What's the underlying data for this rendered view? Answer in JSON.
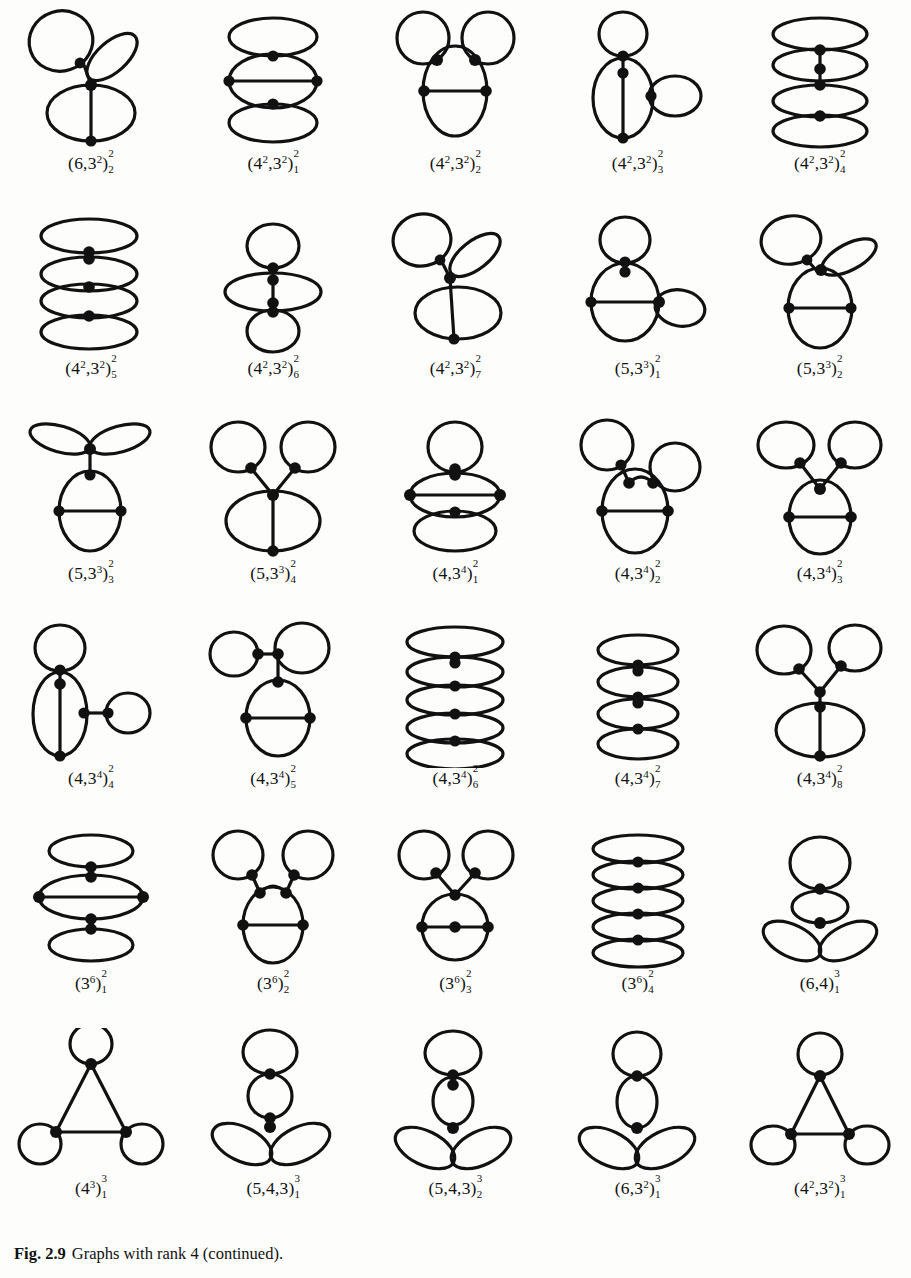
{
  "page": {
    "kind": "textbook-figure-page",
    "background_color": "#fdfdfc",
    "ink_color": "#111111",
    "grid": {
      "rows": 6,
      "cols": 5,
      "total_graphs": 30
    }
  },
  "caption": {
    "figure_number": "Fig. 2.9",
    "text": "Graphs with rank 4 (continued)."
  },
  "graphs": [
    {
      "id": "g1",
      "row": 1,
      "col": 1,
      "label_plain": "(6,3^2)_2^2",
      "base": "(6,3",
      "base_sup": "2",
      "base_close": ")",
      "upper": "2",
      "lower": "2",
      "vertices": 4,
      "shape": "loop-loop-ellipse-spine"
    },
    {
      "id": "g2",
      "row": 1,
      "col": 2,
      "label_plain": "(4^2,3^2)_1^2",
      "base": "(4",
      "base_sup": "2",
      "base_mid": ",3",
      "base_sup2": "2",
      "base_close": ")",
      "upper": "2",
      "lower": "1",
      "vertices": 4,
      "shape": "stacked-ellipses-with-chord"
    },
    {
      "id": "g3",
      "row": 1,
      "col": 3,
      "label_plain": "(4^2,3^2)_2^2",
      "base": "(4",
      "base_sup": "2",
      "base_mid": ",3",
      "base_sup2": "2",
      "base_close": ")",
      "upper": "2",
      "lower": "2",
      "vertices": 4,
      "shape": "two-ears-on-oval"
    },
    {
      "id": "g4",
      "row": 1,
      "col": 4,
      "label_plain": "(4^2,3^2)_3^2",
      "base": "(4",
      "base_sup": "2",
      "base_mid": ",3",
      "base_sup2": "2",
      "base_close": ")",
      "upper": "2",
      "lower": "3",
      "vertices": 4,
      "shape": "loop-top-oval-side-loop"
    },
    {
      "id": "g5",
      "row": 1,
      "col": 5,
      "label_plain": "(4^2,3^2)_4^2",
      "base": "(4",
      "base_sup": "2",
      "base_mid": ",3",
      "base_sup2": "2",
      "base_close": ")",
      "upper": "2",
      "lower": "4",
      "vertices": 4,
      "shape": "four-stacked-lenses"
    },
    {
      "id": "g6",
      "row": 2,
      "col": 1,
      "label_plain": "(4^2,3^2)_5^2",
      "base": "(4",
      "base_sup": "2",
      "base_mid": ",3",
      "base_sup2": "2",
      "base_close": ")",
      "upper": "2",
      "lower": "5",
      "vertices": 4,
      "shape": "stack-4-wide-lenses"
    },
    {
      "id": "g7",
      "row": 2,
      "col": 2,
      "label_plain": "(4^2,3^2)_6^2",
      "base": "(4",
      "base_sup": "2",
      "base_mid": ",3",
      "base_sup2": "2",
      "base_close": ")",
      "upper": "2",
      "lower": "6",
      "vertices": 4,
      "shape": "loop-lens-loop-vertical"
    },
    {
      "id": "g8",
      "row": 2,
      "col": 3,
      "label_plain": "(4^2,3^2)_7^2",
      "base": "(4",
      "base_sup": "2",
      "base_mid": ",3",
      "base_sup2": "2",
      "base_close": ")",
      "upper": "2",
      "lower": "7",
      "vertices": 4,
      "shape": "loop-petal-ellipse-spine"
    },
    {
      "id": "g9",
      "row": 2,
      "col": 4,
      "label_plain": "(5,3^3)_1^2",
      "base": "(5,3",
      "base_sup": "3",
      "base_close": ")",
      "upper": "2",
      "lower": "1",
      "vertices": 4,
      "shape": "loop-top-oval-chord-side-petal"
    },
    {
      "id": "g10",
      "row": 2,
      "col": 5,
      "label_plain": "(5,3^3)_2^2",
      "base": "(5,3",
      "base_sup": "3",
      "base_close": ")",
      "upper": "2",
      "lower": "2",
      "vertices": 4,
      "shape": "loop-petal-oval-chord"
    },
    {
      "id": "g11",
      "row": 3,
      "col": 1,
      "label_plain": "(5,3^3)_3^2",
      "base": "(5,3",
      "base_sup": "3",
      "base_close": ")",
      "upper": "2",
      "lower": "3",
      "vertices": 4,
      "shape": "double-petal-over-oval-chord"
    },
    {
      "id": "g12",
      "row": 3,
      "col": 2,
      "label_plain": "(5,3^3)_4^2",
      "base": "(5,3",
      "base_sup": "3",
      "base_close": ")",
      "upper": "2",
      "lower": "4",
      "vertices": 4,
      "shape": "two-loops-y-over-ellipse-spine"
    },
    {
      "id": "g13",
      "row": 3,
      "col": 3,
      "label_plain": "(4,3^4)_1^2",
      "base": "(4,3",
      "base_sup": "4",
      "base_close": ")",
      "upper": "2",
      "lower": "1",
      "vertices": 4,
      "shape": "loop-lens-chord-lens"
    },
    {
      "id": "g14",
      "row": 3,
      "col": 4,
      "label_plain": "(4,3^4)_2^2",
      "base": "(4,3",
      "base_sup": "4",
      "base_close": ")",
      "upper": "2",
      "lower": "2",
      "vertices": 4,
      "shape": "loop-left-loop-right-oval-chord"
    },
    {
      "id": "g15",
      "row": 3,
      "col": 5,
      "label_plain": "(4,3^4)_3^2",
      "base": "(4,3",
      "base_sup": "4",
      "base_close": ")",
      "upper": "2",
      "lower": "3",
      "vertices": 4,
      "shape": "two-loops-y-oval-chord"
    },
    {
      "id": "g16",
      "row": 4,
      "col": 1,
      "label_plain": "(4,3^4)_4^2",
      "base": "(4,3",
      "base_sup": "4",
      "base_close": ")",
      "upper": "2",
      "lower": "4",
      "vertices": 4,
      "shape": "loop-lens-spine-bar-loop"
    },
    {
      "id": "g17",
      "row": 4,
      "col": 2,
      "label_plain": "(4,3^4)_5^2",
      "base": "(4,3",
      "base_sup": "4",
      "base_close": ")",
      "upper": "2",
      "lower": "5",
      "vertices": 4,
      "shape": "loop-pair-top-oval-chord"
    },
    {
      "id": "g18",
      "row": 4,
      "col": 3,
      "label_plain": "(4,3^4)_6^2",
      "base": "(4,3",
      "base_sup": "4",
      "base_close": ")",
      "upper": "2",
      "lower": "6",
      "vertices": 4,
      "shape": "five-stacked-lenses"
    },
    {
      "id": "g19",
      "row": 4,
      "col": 4,
      "label_plain": "(4,3^4)_7^2",
      "base": "(4,3",
      "base_sup": "4",
      "base_close": ")",
      "upper": "2",
      "lower": "7",
      "vertices": 4,
      "shape": "four-lens-chain"
    },
    {
      "id": "g20",
      "row": 4,
      "col": 5,
      "label_plain": "(4,3^4)_8^2",
      "base": "(4,3",
      "base_sup": "4",
      "base_close": ")",
      "upper": "2",
      "lower": "8",
      "vertices": 4,
      "shape": "two-loops-y-ellipse-spine"
    },
    {
      "id": "g21",
      "row": 5,
      "col": 1,
      "label_plain": "(3^6)_1^2",
      "base": "(3",
      "base_sup": "6",
      "base_close": ")",
      "upper": "2",
      "lower": "1",
      "vertices": 4,
      "shape": "lens-stack-with-wide-chord"
    },
    {
      "id": "g22",
      "row": 5,
      "col": 2,
      "label_plain": "(3^6)_2^2",
      "base": "(3",
      "base_sup": "6",
      "base_close": ")",
      "upper": "2",
      "lower": "2",
      "vertices": 4,
      "shape": "two-loops-arch-oval-chord"
    },
    {
      "id": "g23",
      "row": 5,
      "col": 3,
      "label_plain": "(3^6)_3^2",
      "base": "(3",
      "base_sup": "6",
      "base_close": ")",
      "upper": "2",
      "lower": "3",
      "vertices": 4,
      "shape": "two-loops-y-lens-chord"
    },
    {
      "id": "g24",
      "row": 5,
      "col": 4,
      "label_plain": "(3^6)_4^2",
      "base": "(3",
      "base_sup": "6",
      "base_close": ")",
      "upper": "2",
      "lower": "4",
      "vertices": 4,
      "shape": "five-lens-tight-stack"
    },
    {
      "id": "g25",
      "row": 5,
      "col": 5,
      "label_plain": "(6,4)_1^3",
      "base": "(6,4",
      "base_close": ")",
      "upper": "3",
      "lower": "1",
      "vertices": 3,
      "shape": "loop-top-two-petals"
    },
    {
      "id": "g26",
      "row": 6,
      "col": 1,
      "label_plain": "(4^3)_1^3",
      "base": "(4",
      "base_sup": "3",
      "base_close": ")",
      "upper": "3",
      "lower": "1",
      "vertices": 3,
      "shape": "triangle-three-loops"
    },
    {
      "id": "g27",
      "row": 6,
      "col": 2,
      "label_plain": "(5,4,3)_1^3",
      "base": "(5,4,3",
      "base_close": ")",
      "upper": "3",
      "lower": "1",
      "vertices": 3,
      "shape": "loop-lens-two-petals"
    },
    {
      "id": "g28",
      "row": 6,
      "col": 3,
      "label_plain": "(5,4,3)_2^3",
      "base": "(5,4,3",
      "base_close": ")",
      "upper": "3",
      "lower": "2",
      "vertices": 3,
      "shape": "loop-lens-two-petals-b"
    },
    {
      "id": "g29",
      "row": 6,
      "col": 4,
      "label_plain": "(6,3^2)_1^3",
      "base": "(6,3",
      "base_sup": "2",
      "base_close": ")",
      "upper": "3",
      "lower": "1",
      "vertices": 3,
      "shape": "loop-lens-two-petals-c"
    },
    {
      "id": "g30",
      "row": 6,
      "col": 5,
      "label_plain": "(4^2,3^2)_1^3",
      "base": "(4",
      "base_sup": "2",
      "base_mid": ",3",
      "base_sup2": "2",
      "base_close": ")",
      "upper": "3",
      "lower": "1",
      "vertices": 3,
      "shape": "triangle-loop-top-two-loops"
    }
  ]
}
